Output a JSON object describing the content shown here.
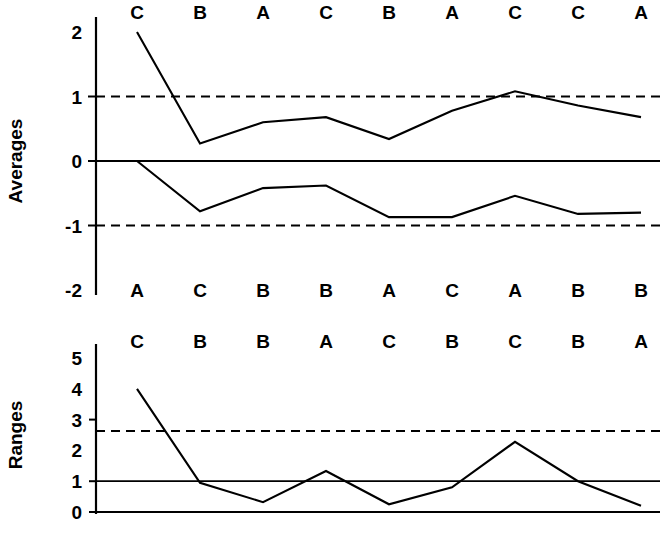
{
  "chart_data": [
    {
      "type": "line",
      "name": "averages-chart",
      "title": "",
      "ylabel": "Averages",
      "xlabel": "",
      "ylim": [
        -2,
        2
      ],
      "yticks": [
        2,
        1,
        0,
        -1,
        -2
      ],
      "ytick_labels": [
        "2",
        "1",
        "0",
        "-1",
        "-2"
      ],
      "grid": false,
      "legend": "none",
      "x": [
        1,
        2,
        3,
        4,
        5,
        6,
        7,
        8,
        9
      ],
      "top_labels": [
        "C",
        "B",
        "A",
        "C",
        "B",
        "A",
        "C",
        "C",
        "A"
      ],
      "bottom_labels": [
        "A",
        "C",
        "B",
        "B",
        "A",
        "C",
        "A",
        "B",
        "B"
      ],
      "reference_lines": [
        {
          "value": 1,
          "style": "dashed",
          "label": "upper-control-limit"
        },
        {
          "value": 0,
          "style": "solid",
          "label": "center-line"
        },
        {
          "value": -1,
          "style": "dashed",
          "label": "lower-control-limit"
        }
      ],
      "series": [
        {
          "name": "upper-averages",
          "values": [
            2.0,
            0.27,
            0.6,
            0.68,
            0.34,
            0.78,
            1.08,
            0.86,
            0.68
          ]
        },
        {
          "name": "lower-averages",
          "values": [
            0.0,
            -0.78,
            -0.42,
            -0.38,
            -0.87,
            -0.87,
            -0.54,
            -0.82,
            -0.8
          ]
        }
      ]
    },
    {
      "type": "line",
      "name": "ranges-chart",
      "title": "",
      "ylabel": "Ranges",
      "xlabel": "",
      "ylim": [
        0,
        5
      ],
      "yticks": [
        5,
        4,
        3,
        2,
        1,
        0
      ],
      "ytick_labels": [
        "5",
        "4",
        "3",
        "2",
        "1",
        "0"
      ],
      "grid": false,
      "legend": "none",
      "x": [
        1,
        2,
        3,
        4,
        5,
        6,
        7,
        8,
        9
      ],
      "top_labels": [
        "C",
        "B",
        "B",
        "A",
        "C",
        "B",
        "C",
        "B",
        "A"
      ],
      "reference_lines": [
        {
          "value": 2.63,
          "style": "dashed",
          "label": "upper-range-limit"
        },
        {
          "value": 1.0,
          "style": "solid",
          "label": "center-range-line"
        },
        {
          "value": 0.0,
          "style": "solid",
          "label": "baseline"
        }
      ],
      "series": [
        {
          "name": "ranges",
          "values": [
            4.0,
            0.95,
            0.32,
            1.33,
            0.25,
            0.8,
            2.28,
            1.0,
            0.2
          ]
        }
      ]
    }
  ],
  "colors": {
    "ink": "#000000",
    "background": "#ffffff"
  }
}
